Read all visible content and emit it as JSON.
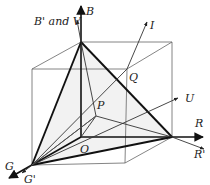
{
  "diagram": {
    "labels": {
      "B": "B",
      "B_prime_V": "B' and V",
      "I": "I",
      "Q": "Q",
      "P": "P",
      "U": "U",
      "O": "O",
      "R": "R",
      "R_prime": "R'",
      "G": "G",
      "G_prime": "G'"
    },
    "points": {
      "O": [
        81,
        137
      ],
      "B": [
        81,
        42
      ],
      "R": [
        172,
        137
      ],
      "G": [
        32,
        165
      ],
      "P": [
        96,
        116
      ],
      "Q": [
        127,
        69
      ],
      "cube_back_top_right": [
        172,
        42
      ],
      "cube_front_top_left": [
        32,
        69
      ],
      "cube_front_top_right": [
        127,
        69
      ],
      "cube_front_bottom_right": [
        125,
        163
      ]
    },
    "colors": {
      "triangle_fill": "#f2f2f2",
      "stroke_dark": "#111111",
      "stroke_light": "#666666"
    }
  }
}
